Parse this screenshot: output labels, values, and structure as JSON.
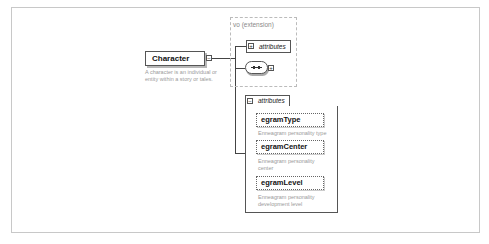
{
  "element": {
    "name": "Character",
    "description": "A character is an individual or entity within a story or tales.",
    "toggle_symbol": "−"
  },
  "extension": {
    "label": "vo (extension)",
    "attributes_label": "attributes",
    "attributes_toggle": "+",
    "sequence_toggle": "+"
  },
  "attributes": {
    "label": "attributes",
    "toggle": "−",
    "items": [
      {
        "name": "egramType",
        "description": "Enneagram personality type"
      },
      {
        "name": "egramCenter",
        "description": "Enneagram personality center"
      },
      {
        "name": "egramLevel",
        "description": "Enneagram personality development level"
      }
    ]
  }
}
